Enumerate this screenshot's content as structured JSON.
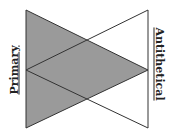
{
  "labels": {
    "left": "Primary",
    "right": "Antithetical"
  },
  "colors": {
    "shaded_fill": "#9a9a9a",
    "line": "#333333",
    "background": "#ffffff"
  },
  "shapes": [
    {
      "name": "primary-triangle",
      "points": [
        [
          26,
          10
        ],
        [
          26,
          128
        ],
        [
          148,
          70
        ]
      ],
      "filled": true
    },
    {
      "name": "antithetical-triangle",
      "points": [
        [
          148,
          10
        ],
        [
          148,
          128
        ],
        [
          26,
          70
        ]
      ],
      "filled": false
    }
  ]
}
